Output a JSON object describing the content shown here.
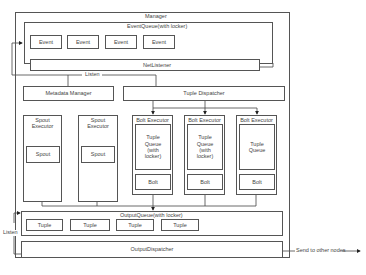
{
  "diagram": {
    "manager": {
      "label": "Manager"
    },
    "event_queue": {
      "label": "EventQueue(with locker)",
      "events": [
        "Event",
        "Event",
        "Event",
        "Event"
      ]
    },
    "net_listener": {
      "label": "NetListener"
    },
    "listen_top": {
      "label": "Listen"
    },
    "metadata_manager": {
      "label": "Metadata Manager"
    },
    "tuple_dispatcher": {
      "label": "Tuple Dispatcher"
    },
    "spout_executors": [
      {
        "label": "Spout Executor",
        "inner": "Spout"
      },
      {
        "label": "Spout Executor",
        "inner": "Spout"
      }
    ],
    "bolt_executors": [
      {
        "label": "Bolt Executor",
        "queue": "Tuple Queue (with locker)",
        "inner": "Bolt"
      },
      {
        "label": "Bolt Executor",
        "queue": "Tuple Queue (with locker)",
        "inner": "Bolt"
      },
      {
        "label": "Bolt Executor",
        "queue": "Tuple Queue",
        "inner": "Bolt"
      }
    ],
    "output_queue": {
      "label": "OutputQueue(with locker)",
      "tuples": [
        "Tuple",
        "Tuple",
        "Tuple",
        "Tuple"
      ]
    },
    "output_dispatcher": {
      "label": "OutputDispatcher"
    },
    "listen_bottom": {
      "label": "Listen"
    },
    "send_out": {
      "label": "Send to other nodes"
    }
  }
}
